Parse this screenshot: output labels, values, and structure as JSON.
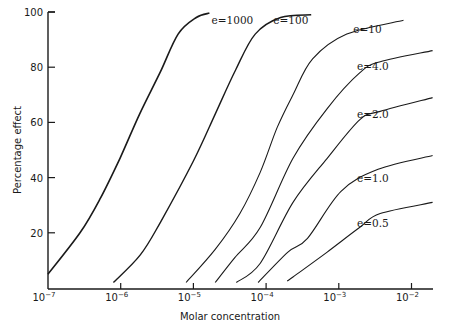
{
  "chart_data": {
    "type": "line",
    "title": "",
    "xlabel": "Molar concentration",
    "ylabel": "Percentage effect",
    "xscale": "log",
    "xlim": [
      1e-07,
      0.01
    ],
    "ylim": [
      0,
      100
    ],
    "grid": false,
    "legend": "inline labels at curve ends",
    "x_ticks": [
      {
        "value": -7,
        "base": "10",
        "exp": "−7"
      },
      {
        "value": -6,
        "base": "10",
        "exp": "−6"
      },
      {
        "value": -5,
        "base": "10",
        "exp": "−5"
      },
      {
        "value": -4,
        "base": "10",
        "exp": "−4"
      },
      {
        "value": -3,
        "base": "10",
        "exp": "−3"
      },
      {
        "value": -2,
        "base": "10",
        "exp": "−2"
      }
    ],
    "y_ticks": [
      20,
      40,
      60,
      80,
      100
    ],
    "series": [
      {
        "name": "e=1000",
        "label": "e=1000",
        "label_pos": [
          -4.75,
          95.5
        ],
        "stroke": 1.6,
        "log10_x": [
          -7.0,
          -6.56,
          -6.29,
          -6.01,
          -5.74,
          -5.46,
          -5.21,
          -4.96,
          -4.78
        ],
        "y": [
          5,
          20,
          32,
          47,
          63,
          78,
          92,
          98,
          99.6
        ]
      },
      {
        "name": "e=100",
        "label": "e=100",
        "label_pos": [
          -3.9,
          95.5
        ],
        "stroke": 1.4,
        "log10_x": [
          -6.1,
          -5.73,
          -5.45,
          -5.0,
          -4.7,
          -4.42,
          -4.15,
          -3.8,
          -3.38
        ],
        "y": [
          2,
          12,
          24,
          46,
          63,
          79,
          92,
          98,
          99
        ]
      },
      {
        "name": "e=10",
        "label": "e=10",
        "label_pos": [
          -2.8,
          92.5
        ],
        "stroke": 1.1,
        "log10_x": [
          -5.1,
          -4.7,
          -4.36,
          -4.08,
          -3.85,
          -3.63,
          -3.36,
          -2.89,
          -2.11
        ],
        "y": [
          2,
          14,
          27,
          42,
          58,
          70,
          83,
          92,
          97
        ]
      },
      {
        "name": "e=4.0",
        "label": "e=4.0",
        "label_pos": [
          -2.75,
          79
        ],
        "stroke": 1.1,
        "log10_x": [
          -4.7,
          -4.43,
          -4.08,
          -3.63,
          -3.16,
          -2.71,
          -2.43,
          -1.71
        ],
        "y": [
          2,
          11,
          22,
          47,
          65,
          78,
          82,
          86
        ]
      },
      {
        "name": "e=2.0",
        "label": "e=2.0",
        "label_pos": [
          -2.75,
          61.5
        ],
        "stroke": 1.1,
        "log10_x": [
          -4.41,
          -4.08,
          -3.63,
          -3.16,
          -2.71,
          -2.43,
          -1.71
        ],
        "y": [
          2,
          9,
          31,
          47,
          61,
          64,
          69
        ]
      },
      {
        "name": "e=1.0",
        "label": "e=1.0",
        "label_pos": [
          -2.75,
          38.5
        ],
        "stroke": 1.1,
        "log10_x": [
          -4.11,
          -3.7,
          -3.43,
          -2.97,
          -2.46,
          -1.71
        ],
        "y": [
          2,
          13,
          18,
          35,
          43,
          48
        ]
      },
      {
        "name": "e=0.5",
        "label": "e=0.5",
        "label_pos": [
          -2.75,
          22
        ],
        "stroke": 1.1,
        "log10_x": [
          -3.71,
          -3.63,
          -3.16,
          -2.71,
          -2.43,
          -1.71
        ],
        "y": [
          2.5,
          4,
          13,
          22,
          27,
          31
        ]
      }
    ]
  }
}
